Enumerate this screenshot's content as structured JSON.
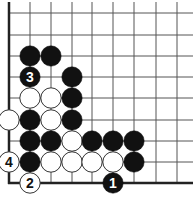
{
  "diagram": {
    "type": "go-board-corner",
    "corner": "bottom-left",
    "grid": {
      "columns_x": [
        9,
        30,
        51,
        72,
        92,
        113,
        134,
        156,
        177
      ],
      "rows_y": [
        13,
        35,
        56,
        77,
        98,
        120,
        141,
        162,
        183
      ],
      "right_extent": 193,
      "top_extent": 2,
      "edge_left_x": 9,
      "edge_bottom_y": 183
    },
    "colors": {
      "black": "#111111",
      "white": "#ffffff",
      "line": "#555555",
      "edge": "#222222"
    },
    "stones": [
      {
        "color": "black",
        "col": 1,
        "row": 2,
        "label": ""
      },
      {
        "color": "black",
        "col": 2,
        "row": 2,
        "label": ""
      },
      {
        "color": "black",
        "col": 1,
        "row": 3,
        "label": "3"
      },
      {
        "color": "black",
        "col": 3,
        "row": 3,
        "label": ""
      },
      {
        "color": "white",
        "col": 1,
        "row": 4,
        "label": ""
      },
      {
        "color": "white",
        "col": 2,
        "row": 4,
        "label": ""
      },
      {
        "color": "black",
        "col": 3,
        "row": 4,
        "label": ""
      },
      {
        "color": "white",
        "col": 0,
        "row": 5,
        "label": ""
      },
      {
        "color": "black",
        "col": 1,
        "row": 5,
        "label": ""
      },
      {
        "color": "white",
        "col": 2,
        "row": 5,
        "label": ""
      },
      {
        "color": "black",
        "col": 3,
        "row": 5,
        "label": ""
      },
      {
        "color": "black",
        "col": 1,
        "row": 6,
        "label": ""
      },
      {
        "color": "black",
        "col": 2,
        "row": 6,
        "label": ""
      },
      {
        "color": "white",
        "col": 3,
        "row": 6,
        "label": ""
      },
      {
        "color": "black",
        "col": 4,
        "row": 6,
        "label": ""
      },
      {
        "color": "black",
        "col": 5,
        "row": 6,
        "label": ""
      },
      {
        "color": "black",
        "col": 6,
        "row": 6,
        "label": ""
      },
      {
        "color": "white",
        "col": 0,
        "row": 7,
        "label": "4"
      },
      {
        "color": "black",
        "col": 1,
        "row": 7,
        "label": ""
      },
      {
        "color": "white",
        "col": 2,
        "row": 7,
        "label": ""
      },
      {
        "color": "white",
        "col": 3,
        "row": 7,
        "label": ""
      },
      {
        "color": "white",
        "col": 4,
        "row": 7,
        "label": ""
      },
      {
        "color": "white",
        "col": 5,
        "row": 7,
        "label": ""
      },
      {
        "color": "black",
        "col": 6,
        "row": 7,
        "label": ""
      },
      {
        "color": "white",
        "col": 1,
        "row": 8,
        "label": "2"
      },
      {
        "color": "black",
        "col": 5,
        "row": 8,
        "label": "1"
      }
    ],
    "move_labels": [
      "1",
      "2",
      "3",
      "4"
    ]
  }
}
